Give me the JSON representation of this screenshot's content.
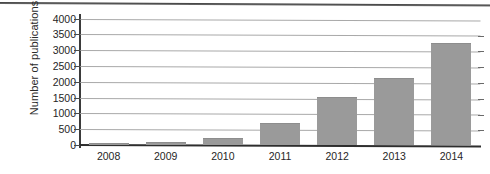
{
  "chart_data": {
    "type": "bar",
    "title": "",
    "xlabel": "",
    "ylabel": "Number of publications",
    "categories": [
      "2008",
      "2009",
      "2010",
      "2011",
      "2012",
      "2013",
      "2014"
    ],
    "values": [
      5,
      60,
      200,
      650,
      1500,
      2100,
      3200
    ],
    "ylim": [
      0,
      4000
    ],
    "y_ticks": [
      "0",
      "500",
      "1000",
      "1500",
      "2000",
      "2500",
      "3000",
      "3500",
      "4000"
    ],
    "y_tick_values": [
      0,
      500,
      1000,
      1500,
      2000,
      2500,
      3000,
      3500,
      4000
    ],
    "grid": true,
    "legend": "none",
    "bar_color": "#9a9a9a",
    "gridline_color": "#a9a9a9",
    "axis_color": "#2e2e2e",
    "background": "#ffffff"
  }
}
